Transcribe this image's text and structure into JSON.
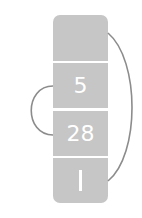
{
  "diagram": {
    "type": "linked-cell-stack",
    "cells": [
      {
        "label": ""
      },
      {
        "label": "5"
      },
      {
        "label": "28"
      },
      {
        "label": "I"
      }
    ],
    "links": [
      {
        "from": 1,
        "to": 2,
        "side": "left"
      },
      {
        "from": 0,
        "to": 3,
        "side": "right"
      }
    ],
    "colors": {
      "cell_fill": "#c6c6c6",
      "cell_text": "#ffffff",
      "link_stroke": "#8c8c8c",
      "background": "#ffffff"
    }
  }
}
